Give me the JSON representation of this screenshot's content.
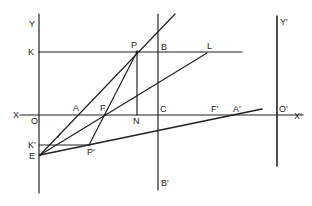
{
  "diagram": {
    "type": "geometric optics construction",
    "stroke_color": "#222222",
    "background": "#ffffff",
    "labels": {
      "Y": "Y",
      "K": "K",
      "P": "P",
      "B": "B",
      "L": "L",
      "Y_prime": "Y′",
      "X": "X",
      "O": "O",
      "A": "A",
      "F": "F",
      "N": "N",
      "C": "C",
      "F_prime": "F′",
      "A_prime": "A′",
      "O_prime": "O′",
      "X_prime": "X′",
      "K_prime": "K′",
      "E": "E",
      "P_prime": "P′",
      "B_prime": "B′",
      "small_angle_mark": "′"
    },
    "lines": [
      {
        "name": "y-axis",
        "from": "Y",
        "to": "below E"
      },
      {
        "name": "x-axis",
        "from": "X",
        "to": "X′"
      },
      {
        "name": "line-K-L",
        "from": "K",
        "to": "beyond L"
      },
      {
        "name": "line-B-B-prime",
        "from": "top",
        "to": "B′"
      },
      {
        "name": "line-Y-prime-O-prime",
        "from": "Y′",
        "to": "below O′"
      },
      {
        "name": "line-P-N",
        "from": "P",
        "to": "N"
      },
      {
        "name": "ray-E-through-A-P",
        "from": "E",
        "to": "beyond P"
      },
      {
        "name": "ray-E-through-F-L",
        "from": "E",
        "to": "L"
      },
      {
        "name": "ray-E-through-P-prime-A-prime",
        "from": "E",
        "to": "beyond A′"
      },
      {
        "name": "line-P-F-P-prime",
        "from": "P",
        "to": "P′"
      },
      {
        "name": "line-K-prime-P-prime",
        "from": "K′",
        "to": "P′"
      }
    ]
  }
}
